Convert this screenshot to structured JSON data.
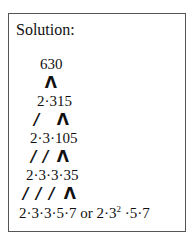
{
  "title": "Solution:",
  "tree": {
    "root": "630",
    "rows": [
      {
        "text": "2·315",
        "connectors": [
          "Λ"
        ]
      },
      {
        "text": "2·3·105",
        "connectors": [
          "/",
          "Λ"
        ]
      },
      {
        "text": "2·3·3·35",
        "connectors": [
          "/",
          "/",
          "Λ"
        ]
      },
      {
        "text_prefix": "2·3·3·5·7 or 2·3",
        "exponent": "2",
        "text_suffix": " ·5·7",
        "connectors": [
          "/",
          "/",
          "/",
          "Λ"
        ]
      }
    ]
  },
  "labels": {
    "root": "630",
    "c0": "Λ",
    "row1": "2·315",
    "c1a": "/",
    "c1b": "Λ",
    "row2": "2·3·105",
    "c2a": "/",
    "c2b": "/",
    "c2c": "Λ",
    "row3": "2·3·3·35",
    "c3a": "/",
    "c3b": "/",
    "c3c": "/",
    "c3d": "Λ",
    "final_prefix": "2·3·3·5·7 or 2·3",
    "final_exp": "2",
    "final_suffix": " ·5·7"
  }
}
